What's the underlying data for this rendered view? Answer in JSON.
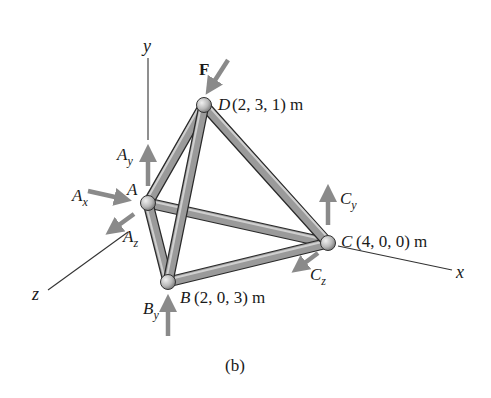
{
  "figure": {
    "caption": "(b)",
    "colors": {
      "member": "#8e8e8e",
      "member_edge": "#2a2a2a",
      "force_arrow": "#8a8a8a",
      "axis": "#222222",
      "joint": "#bdbdbd"
    }
  },
  "axes": {
    "x": "x",
    "y": "y",
    "z": "z"
  },
  "joints": {
    "A": {
      "name": "A",
      "coords": ""
    },
    "B": {
      "name": "B",
      "coords": "(2, 0, 3) m"
    },
    "C": {
      "name": "C",
      "coords": "(4, 0, 0) m"
    },
    "D": {
      "name": "D",
      "coords": "(2, 3, 1) m"
    }
  },
  "members": [
    "AD",
    "AB",
    "AC",
    "BD",
    "BC",
    "CD"
  ],
  "forces": {
    "F": {
      "symbol": "F"
    },
    "Ax": {
      "base": "A",
      "sub": "x"
    },
    "Ay": {
      "base": "A",
      "sub": "y"
    },
    "Az": {
      "base": "A",
      "sub": "z"
    },
    "By": {
      "base": "B",
      "sub": "y"
    },
    "Cy": {
      "base": "C",
      "sub": "y"
    },
    "Cz": {
      "base": "C",
      "sub": "z"
    }
  }
}
